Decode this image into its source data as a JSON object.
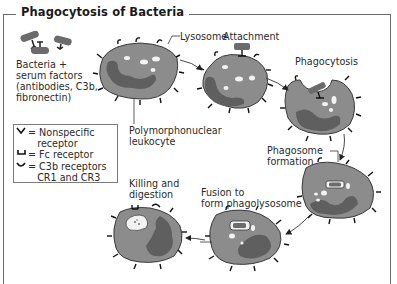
{
  "title": "Phagocytosis of Bacteria",
  "labels": {
    "bacteria": "Bacteria +\nserum factors\n(antibodies, C3b,\nfibronectin)",
    "lysosome": "Lysosome",
    "attachment": "Attachment",
    "phagocytosis": "Phagocytosis",
    "pmn": "Polymorphonuclear\nleukocyte",
    "phagosome": "Phagosome\nformation",
    "fusion": "Fusion to\nform phagolysosome",
    "killing": "Killing and\ndigestion"
  },
  "legend": {
    "items": [
      {
        "symbol": "nonspecific-receptor",
        "text": "= Nonspecific\n   receptor"
      },
      {
        "symbol": "fc-receptor",
        "text": "= Fc receptor"
      },
      {
        "symbol": "c3b-receptor",
        "text": "= C3b receptors\n   CR1 and CR3"
      }
    ]
  },
  "colors": {
    "cell_fill": "#8c8c8c",
    "nucleus": "#5f5f5f",
    "outline": "#3a3a3a",
    "bacterium": "#6b6b6b",
    "vesicle": "#f2f2f2",
    "frame": "#6a6a6a"
  }
}
